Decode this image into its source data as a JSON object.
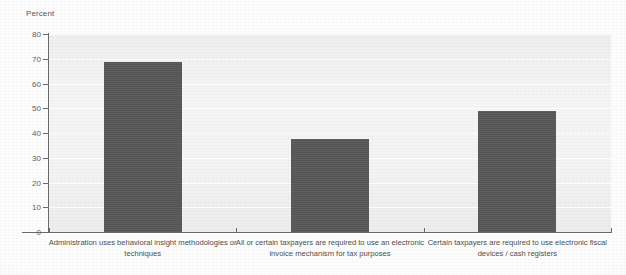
{
  "chart_data": {
    "type": "bar",
    "title": "",
    "subtitle": "",
    "xlabel": "",
    "ylabel": "Percent",
    "ylim": [
      0,
      80
    ],
    "yticks": [
      0,
      10,
      20,
      30,
      40,
      50,
      60,
      70,
      80
    ],
    "ytick_labels": [
      "0",
      "10",
      "20",
      "30",
      "40",
      "50",
      "60",
      "70",
      "80"
    ],
    "grid": true,
    "legend": false,
    "legend_position": "none",
    "bar_color": "#585858",
    "plot_background": "#f2f2f2",
    "categories": [
      "Administration uses behavioral insight methodologies or techniques",
      "All or certain taxpayers are required to use an electronic invoice mechanism for tax purposes",
      "Certain taxpayers are required to use electronic fiscal devices / cash registers"
    ],
    "values": [
      68.5,
      37.5,
      49.0
    ],
    "series": [
      {
        "name": "Percent",
        "values": [
          68.5,
          37.5,
          49.0
        ]
      }
    ]
  },
  "axis": {
    "y_title": "Percent"
  }
}
